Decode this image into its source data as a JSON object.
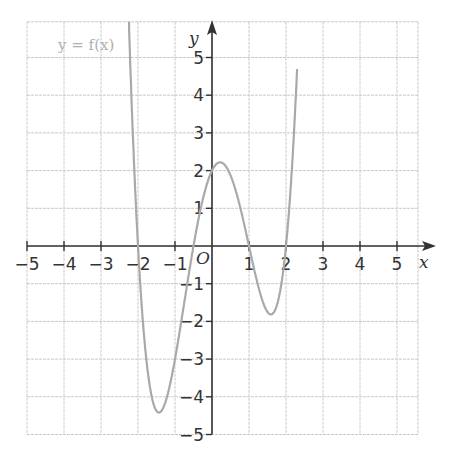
{
  "chart_data": {
    "type": "line",
    "title": "",
    "function_label": "y = f(x)",
    "xlabel": "x",
    "ylabel": "y",
    "origin_label": "O",
    "xlim": [
      -5,
      6
    ],
    "ylim": [
      -5,
      6
    ],
    "x_ticks": [
      -5,
      -4,
      -3,
      -2,
      -1,
      1,
      2,
      3,
      4,
      5
    ],
    "x_tick_labels": [
      "−5",
      "−4",
      "−3",
      "−2",
      "−1",
      "1",
      "2",
      "3",
      "4",
      "5"
    ],
    "y_ticks": [
      -5,
      -4,
      -3,
      -2,
      -1,
      1,
      2,
      3,
      4,
      5
    ],
    "y_tick_labels": [
      "−5",
      "−4",
      "−3",
      "−2",
      "−1",
      "1",
      "2",
      "3",
      "4",
      "5"
    ],
    "grid": true,
    "curve_color": "#a9a9a9",
    "x_intercepts": [
      -2,
      -0.5,
      1,
      2
    ],
    "y_intercept": 2,
    "key_points": [
      {
        "label": "local minimum",
        "x": -1.4,
        "y": -4.4
      },
      {
        "label": "local maximum",
        "x": 0.3,
        "y": 2.2
      },
      {
        "label": "local minimum",
        "x": 1.55,
        "y": -1.8
      }
    ],
    "series": [
      {
        "name": "y = f(x)",
        "x": [
          -2.2,
          -2.0,
          -1.8,
          -1.6,
          -1.4,
          -1.2,
          -1.0,
          -0.8,
          -0.5,
          -0.2,
          0.0,
          0.3,
          0.6,
          0.8,
          1.0,
          1.2,
          1.4,
          1.55,
          1.7,
          1.9,
          2.0,
          2.2,
          2.4
        ],
        "y": [
          5.9,
          0.0,
          -2.9,
          -4.1,
          -4.4,
          -4.0,
          -3.0,
          -1.8,
          0.0,
          1.4,
          2.0,
          2.2,
          1.6,
          0.9,
          0.0,
          -0.9,
          -1.6,
          -1.8,
          -1.6,
          -0.7,
          0.0,
          2.4,
          6.0
        ]
      }
    ]
  }
}
